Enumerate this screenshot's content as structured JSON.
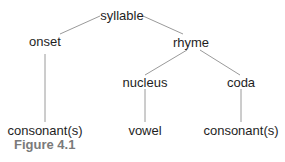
{
  "diagram": {
    "type": "tree",
    "line_color": "#9a9a9a",
    "nodes": {
      "syllable": "syllable",
      "onset": "onset",
      "rhyme": "rhyme",
      "nucleus": "nucleus",
      "coda": "coda",
      "onset_leaf": "consonant(s)",
      "nucleus_leaf": "vowel",
      "coda_leaf": "consonant(s)"
    },
    "edges": [
      [
        "syllable",
        "onset"
      ],
      [
        "syllable",
        "rhyme"
      ],
      [
        "rhyme",
        "nucleus"
      ],
      [
        "rhyme",
        "coda"
      ],
      [
        "onset",
        "consonant(s)"
      ],
      [
        "nucleus",
        "vowel"
      ],
      [
        "coda",
        "consonant(s)"
      ]
    ]
  },
  "caption": "Figure 4.1"
}
